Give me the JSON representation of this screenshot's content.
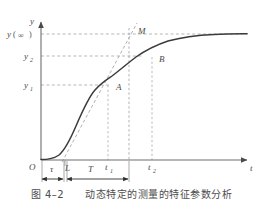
{
  "figure": {
    "type": "line-diagram",
    "axes": {
      "y_axis_label": "y",
      "x_axis_label": "t",
      "origin_label": "O"
    },
    "y_gridline_labels": {
      "y_infinity": "y",
      "y_infinity_paren_open": "(",
      "y_infinity_symbol": "∞",
      "y_infinity_paren_close": ")",
      "y2_base": "y",
      "y2_sub": "2",
      "y1_base": "y",
      "y1_sub": "1"
    },
    "curve_points": [
      {
        "name": "point-A",
        "label": "A"
      },
      {
        "name": "point-B",
        "label": "B"
      },
      {
        "name": "point-M",
        "label": "M"
      }
    ],
    "x_tick_labels": [
      {
        "name": "tau",
        "label": "τ"
      },
      {
        "name": "L",
        "label": "L"
      },
      {
        "name": "T",
        "label": "T"
      },
      {
        "name": "t1-base",
        "label": "t",
        "sub": "1"
      },
      {
        "name": "t2-base",
        "label": "t",
        "sub": "2"
      }
    ],
    "dimension_arrows": [
      {
        "name": "tau-span",
        "label": "τ"
      },
      {
        "name": "T-span",
        "label": "T"
      }
    ],
    "colors": {
      "curve": "#3b3b3b",
      "axis": "#6e6e6e",
      "dashed_guide": "#8f8f8f",
      "tangent": "#9a9a9a",
      "text": "#4a4a4a",
      "background": "#ffffff"
    }
  },
  "caption": {
    "text": "图 4–2　　动态特定的测量的特征参数分析"
  }
}
